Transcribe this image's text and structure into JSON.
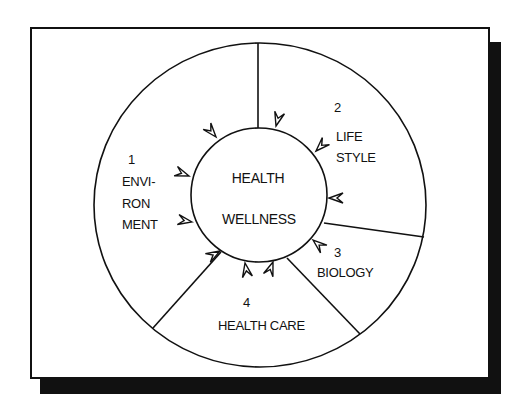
{
  "diagram": {
    "center": {
      "line1": "HEALTH",
      "line2": "WELLNESS"
    },
    "sectors": [
      {
        "number": "1",
        "lines": [
          "ENVI-",
          "RON",
          "MENT"
        ],
        "name": "Environment"
      },
      {
        "number": "2",
        "lines": [
          "LIFE",
          "STYLE"
        ],
        "name": "Life Style"
      },
      {
        "number": "3",
        "lines": [
          "BIOLOGY"
        ],
        "name": "Biology"
      },
      {
        "number": "4",
        "lines": [
          "HEALTH CARE"
        ],
        "name": "Health Care"
      }
    ],
    "colors": {
      "stroke": "#111111",
      "background": "#ffffff",
      "shadow": "#111111"
    }
  }
}
